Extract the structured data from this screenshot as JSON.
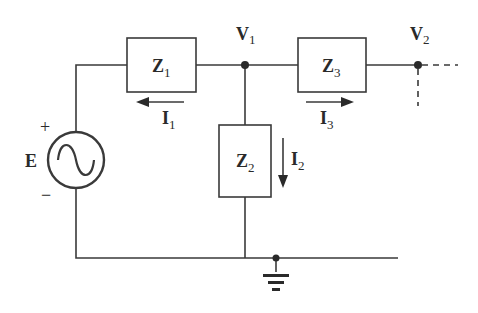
{
  "diagram": {
    "type": "ac-circuit-nodal",
    "source": {
      "label": "E",
      "plus": "+",
      "minus": "−",
      "symbol": "sine-wave"
    },
    "impedances": [
      {
        "id": "Z1",
        "main": "Z",
        "sub": "1"
      },
      {
        "id": "Z2",
        "main": "Z",
        "sub": "2"
      },
      {
        "id": "Z3",
        "main": "Z",
        "sub": "3"
      }
    ],
    "currents": [
      {
        "id": "I1",
        "main": "I",
        "sub": "1",
        "direction": "left"
      },
      {
        "id": "I2",
        "main": "I",
        "sub": "2",
        "direction": "down"
      },
      {
        "id": "I3",
        "main": "I",
        "sub": "3",
        "direction": "right"
      }
    ],
    "nodes": [
      {
        "id": "V1",
        "main": "V",
        "sub": "1"
      },
      {
        "id": "V2",
        "main": "V",
        "sub": "2"
      }
    ],
    "ground": "ground-symbol",
    "colors": {
      "line": "#3a3a3a",
      "background": "#ffffff"
    }
  }
}
